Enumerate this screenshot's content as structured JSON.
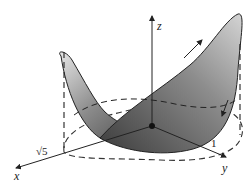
{
  "figure": {
    "axes": {
      "x_label": "x",
      "y_label": "y",
      "z_label": "z"
    },
    "annotations": {
      "x_intercept": "√5",
      "y_intercept": "1"
    },
    "colors": {
      "surface_light": "#d8d8d8",
      "surface_dark": "#3a3a3a",
      "outline": "#222222",
      "dashed": "#333333"
    }
  }
}
